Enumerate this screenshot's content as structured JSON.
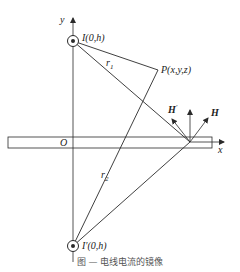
{
  "figure": {
    "caption": "图 — 电线电流的镜像",
    "axes": {
      "y_label": "y",
      "x_label": "x",
      "origin_label": "O"
    },
    "source": {
      "label": "I(0,h)",
      "symbol": "current-out-of-page"
    },
    "image_source": {
      "label": "I′(0,h)",
      "symbol": "current-out-of-page"
    },
    "point": {
      "label": "P(x,y,z)"
    },
    "distances": {
      "r1": "r",
      "r1_sub": "1",
      "r2": "r",
      "r2_sub": "2"
    },
    "fields": {
      "H_label": "H",
      "H_prime_label": "H",
      "H_prime_mark": "′"
    },
    "colors": {
      "line": "#2a2a2a",
      "background": "#ffffff"
    }
  }
}
